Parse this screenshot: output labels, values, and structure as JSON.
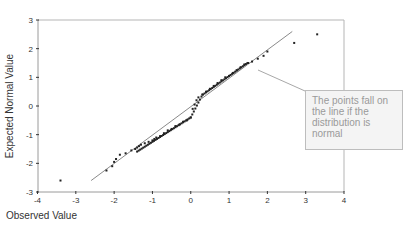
{
  "chart_data": {
    "type": "scatter",
    "title": "",
    "xlabel": "Observed Value",
    "ylabel": "Expected Normal Value",
    "xlim": [
      -4,
      4
    ],
    "ylim": [
      -3,
      3
    ],
    "x_ticks": [
      "-4",
      "-3",
      "-2",
      "-1",
      "0",
      "1",
      "2",
      "3",
      "4"
    ],
    "y_ticks": [
      "3",
      "2",
      "1",
      "0",
      "-1",
      "-2",
      "-3"
    ],
    "grid": false,
    "reference_line": {
      "x": [
        -2.6,
        2.65
      ],
      "y": [
        -2.6,
        2.6
      ]
    },
    "series": [
      {
        "name": "Observations",
        "x": [
          -3.4,
          -2.2,
          -2.05,
          -2.0,
          -1.95,
          -1.85,
          -1.7,
          -1.55,
          -1.45,
          -1.4,
          -1.35,
          -1.3,
          -1.2,
          -1.1,
          -1.0,
          -0.95,
          -0.9,
          -0.8,
          -0.7,
          -0.6,
          -0.5,
          -0.4,
          -0.3,
          -0.2,
          -0.1,
          0.0,
          0.05,
          0.1,
          0.15,
          0.2,
          0.3,
          0.4,
          0.5,
          0.6,
          0.7,
          0.8,
          0.9,
          1.0,
          1.1,
          1.2,
          1.3,
          1.4,
          1.5,
          1.6,
          1.75,
          1.9,
          2.0,
          2.7,
          3.3
        ],
        "y": [
          -2.6,
          -2.25,
          -2.1,
          -1.95,
          -1.85,
          -1.7,
          -1.65,
          -1.55,
          -1.5,
          -1.45,
          -1.4,
          -1.35,
          -1.3,
          -1.25,
          -1.2,
          -1.15,
          -1.1,
          -1.05,
          -0.95,
          -0.85,
          -0.8,
          -0.7,
          -0.65,
          -0.55,
          -0.5,
          -0.4,
          -0.1,
          0.05,
          0.2,
          0.3,
          0.4,
          0.5,
          0.6,
          0.7,
          0.8,
          0.9,
          1.0,
          1.05,
          1.15,
          1.25,
          1.35,
          1.45,
          1.5,
          1.55,
          1.65,
          1.75,
          1.9,
          2.2,
          2.5
        ]
      }
    ],
    "annotation": "The points fall on the line if the distribution is normal"
  },
  "callout": {
    "text": "The points fall on the line if the distribution is normal"
  }
}
